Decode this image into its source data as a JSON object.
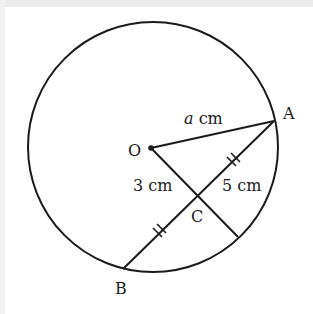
{
  "diagram": {
    "type": "circle-geometry",
    "colors": {
      "stroke": "#1a1a1a",
      "background": "#ffffff",
      "border": "#ececec"
    },
    "circle": {
      "center_label": "O",
      "cx": 153,
      "cy": 147,
      "r": 125
    },
    "points": {
      "O": {
        "label": "O",
        "x": 151,
        "y": 148
      },
      "A": {
        "label": "A",
        "x": 274,
        "y": 121
      },
      "B": {
        "label": "B",
        "x": 123,
        "y": 269
      },
      "C": {
        "label": "C",
        "x": 199,
        "y": 196
      },
      "D": {
        "x": 238,
        "y": 237
      }
    },
    "segments": [
      {
        "from": "O",
        "to": "A",
        "label_var": "a",
        "label_unit": "cm"
      },
      {
        "from": "A",
        "to": "B",
        "note": "chord, bisected at C"
      },
      {
        "from": "O",
        "to": "D",
        "note": "radius through C, perpendicular to AB"
      }
    ],
    "labels": {
      "O": "O",
      "A": "A",
      "B": "B",
      "C": "C",
      "OA_var": "a",
      "OA_unit": " cm",
      "OC": "3 cm",
      "AC": "5 cm"
    },
    "tick_marks": [
      {
        "segment": "AC",
        "count": 2,
        "x": 235,
        "y": 161
      },
      {
        "segment": "CB",
        "count": 2,
        "x": 160,
        "y": 232
      }
    ]
  }
}
